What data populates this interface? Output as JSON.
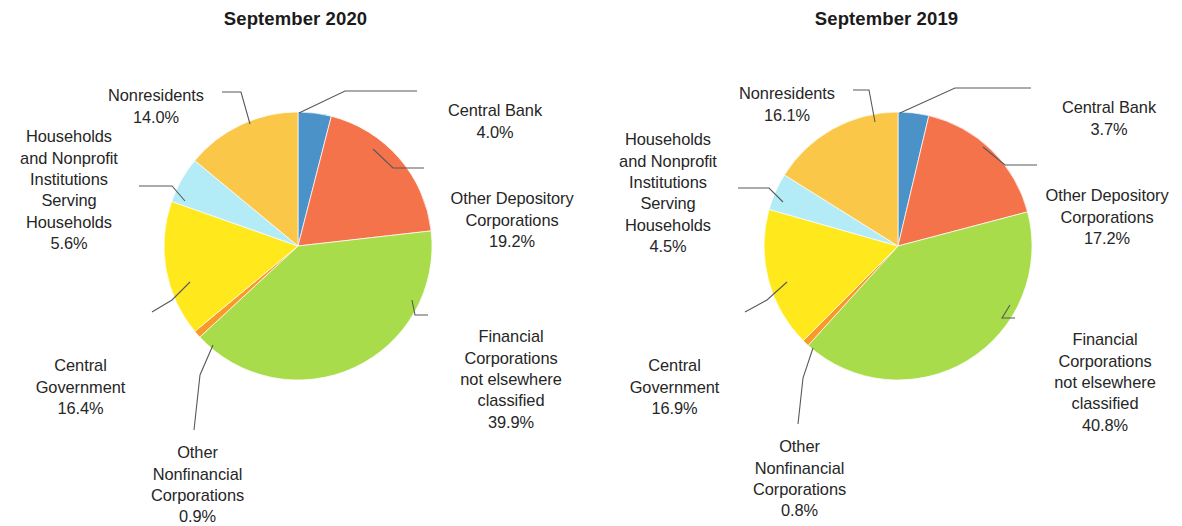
{
  "chart_data": [
    {
      "type": "pie",
      "title": "September 2020",
      "xlabel": "",
      "ylabel": "",
      "legend_position": "callout-labels",
      "grid": false,
      "start_angle_deg": 0,
      "direction": "clockwise",
      "categories": [
        "Central Bank",
        "Other Depository Corporations",
        "Financial Corporations not elsewhere classified",
        "Other Nonfinancial Corporations",
        "Central Government",
        "Households and Nonprofit Institutions Serving Households",
        "Nonresidents"
      ],
      "values": [
        4.0,
        19.2,
        39.9,
        0.9,
        16.4,
        5.6,
        14.0
      ],
      "value_labels": [
        "4.0%",
        "19.2%",
        "39.9%",
        "0.9%",
        "16.4%",
        "5.6%",
        "14.0%"
      ],
      "colors": [
        "#4a92c8",
        "#f4734a",
        "#a8dc4a",
        "#f99a28",
        "#ffe81c",
        "#b3ecf6",
        "#fbc748"
      ]
    },
    {
      "type": "pie",
      "title": "September 2019",
      "xlabel": "",
      "ylabel": "",
      "legend_position": "callout-labels",
      "grid": false,
      "start_angle_deg": 0,
      "direction": "clockwise",
      "categories": [
        "Central Bank",
        "Other Depository Corporations",
        "Financial Corporations not elsewhere classified",
        "Other Nonfinancial Corporations",
        "Central Government",
        "Households and Nonprofit Institutions Serving Households",
        "Nonresidents"
      ],
      "values": [
        3.7,
        17.2,
        40.8,
        0.8,
        16.9,
        4.5,
        16.1
      ],
      "value_labels": [
        "3.7%",
        "17.2%",
        "40.8%",
        "0.8%",
        "16.9%",
        "4.5%",
        "16.1%"
      ],
      "colors": [
        "#4a92c8",
        "#f4734a",
        "#a8dc4a",
        "#f99a28",
        "#ffe81c",
        "#b3ecf6",
        "#fbc748"
      ]
    }
  ],
  "left_chart": {
    "title": "September 2020",
    "labels": {
      "central_bank": {
        "name": "Central Bank",
        "pct": "4.0%"
      },
      "other_depository": {
        "name": "Other Depository\nCorporations",
        "pct": "19.2%"
      },
      "financial_nec": {
        "name": "Financial\nCorporations\nnot elsewhere\nclassified",
        "pct": "39.9%"
      },
      "other_nonfinancial": {
        "name": "Other\nNonfinancial\nCorporations",
        "pct": "0.9%"
      },
      "central_government": {
        "name": "Central\nGovernment",
        "pct": "16.4%"
      },
      "households": {
        "name": "Households\nand Nonprofit\nInstitutions Serving\nHouseholds",
        "pct": "5.6%"
      },
      "nonresidents": {
        "name": "Nonresidents",
        "pct": "14.0%"
      }
    }
  },
  "right_chart": {
    "title": "September 2019",
    "labels": {
      "central_bank": {
        "name": "Central Bank",
        "pct": "3.7%"
      },
      "other_depository": {
        "name": "Other Depository\nCorporations",
        "pct": "17.2%"
      },
      "financial_nec": {
        "name": "Financial\nCorporations\nnot elsewhere\nclassified",
        "pct": "40.8%"
      },
      "other_nonfinancial": {
        "name": "Other\nNonfinancial\nCorporations",
        "pct": "0.8%"
      },
      "central_government": {
        "name": "Central\nGovernment",
        "pct": "16.9%"
      },
      "households": {
        "name": "Households\nand Nonprofit\nInstitutions Serving\nHouseholds",
        "pct": "4.5%"
      },
      "nonresidents": {
        "name": "Nonresidents",
        "pct": "16.1%"
      }
    }
  }
}
